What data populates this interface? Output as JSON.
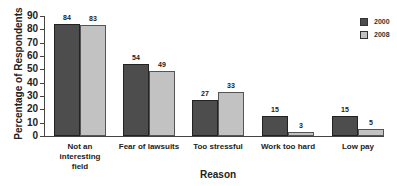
{
  "chart_data": {
    "type": "bar",
    "title": "",
    "xlabel": "Reason",
    "ylabel": "Percentage of Respondents",
    "ylim": [
      0,
      90
    ],
    "yticks": [
      0,
      10,
      20,
      30,
      40,
      50,
      60,
      70,
      80,
      90
    ],
    "categories": [
      "Not an interesting field",
      "Fear of lawsuits",
      "Too stressful",
      "Work too hard",
      "Low pay"
    ],
    "category_lines": [
      [
        "Not an",
        "interesting",
        "field"
      ],
      [
        "Fear of lawsuits"
      ],
      [
        "Too stressful"
      ],
      [
        "Work too hard"
      ],
      [
        "Low pay"
      ]
    ],
    "series": [
      {
        "name": "2000",
        "color": "#4d4d4d",
        "values": [
          84,
          54,
          27,
          15,
          15
        ]
      },
      {
        "name": "2008",
        "color": "#c2c2c2",
        "values": [
          83,
          49,
          33,
          3,
          5
        ]
      }
    ],
    "grid": false,
    "legend_position": "top-right"
  }
}
